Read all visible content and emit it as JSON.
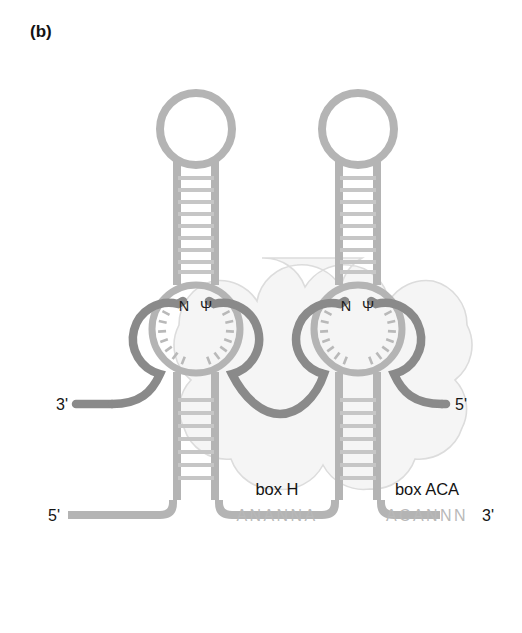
{
  "figure": {
    "panel_label": "(b)",
    "diagram_type": "rna-secondary-structure"
  },
  "colors": {
    "background": "#ffffff",
    "snorna_backbone": "#b4b4b4",
    "snorna_rungs": "#c4c4c4",
    "substrate_rna": "#8a8a8a",
    "protein_cloud_fill": "#f5f5f5",
    "protein_cloud_stroke": "#d6d6d6",
    "text_dark": "#131313",
    "text_sequence": "#b9b9b9"
  },
  "labels": {
    "box_h": "box H",
    "box_aca": "box ACA",
    "sequence_h": "ANANNA",
    "sequence_aca": "ACANNN",
    "snorna_five_prime": "5'",
    "snorna_three_prime": "3'",
    "substrate_three_prime": "3'",
    "substrate_five_prime": "5'",
    "target_nucleotide": "N",
    "pseudouridine": "Ψ"
  },
  "hairpins": [
    {
      "id": "left-hairpin",
      "name": "5-prime-hairpin",
      "upper_stem_rungs": 10,
      "lower_stem_rungs": 8,
      "pocket_tick_marks": 14,
      "pocket_label": "N Ψ",
      "box_label": "box H",
      "box_sequence": "ANANNA"
    },
    {
      "id": "right-hairpin",
      "name": "3-prime-hairpin",
      "upper_stem_rungs": 10,
      "lower_stem_rungs": 8,
      "pocket_tick_marks": 14,
      "pocket_label": "N Ψ",
      "box_label": "box ACA",
      "box_sequence": "ACANNN"
    }
  ],
  "substrate": {
    "name": "target-rna-substrate",
    "three_prime_label": "3'",
    "five_prime_label": "5'"
  }
}
